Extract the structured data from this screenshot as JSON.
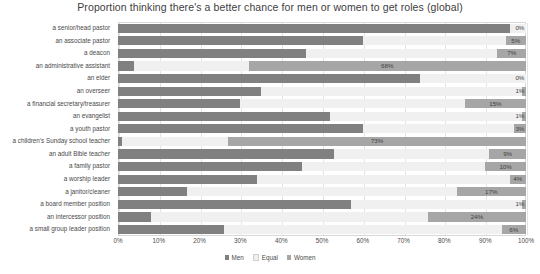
{
  "chart_data": {
    "type": "bar",
    "subtype": "stacked-horizontal-100",
    "title": "Proportion thinking there's a better chance for men or women to get roles (global)",
    "xlabel": "",
    "ylabel": "",
    "xlim": [
      0,
      100
    ],
    "xticks": [
      "0%",
      "10%",
      "20%",
      "30%",
      "40%",
      "50%",
      "60%",
      "70%",
      "80%",
      "90%",
      "100%"
    ],
    "grid": true,
    "legend_position": "bottom",
    "categories": [
      "a senior/head pastor",
      "an associate pastor",
      "a deacon",
      "an administrative assistant",
      "an elder",
      "an overseer",
      "a financial secretary/treasurer",
      "an evangelist",
      "a youth pastor",
      "a children's Sunday school teacher",
      "an adult Bible teacher",
      "a family pastor",
      "a worship leader",
      "a janitor/cleaner",
      "a board member position",
      "an intercessor position",
      "a small group leader position"
    ],
    "series": [
      {
        "name": "Men",
        "color": "#808080",
        "values": [
          96,
          60,
          46,
          4,
          74,
          35,
          30,
          52,
          60,
          1,
          53,
          45,
          34,
          17,
          57,
          8,
          26
        ]
      },
      {
        "name": "Equal",
        "color": "#f0f0f0",
        "values": [
          4,
          35,
          47,
          28,
          26,
          64,
          55,
          47,
          37,
          26,
          38,
          45,
          62,
          66,
          42,
          68,
          68
        ]
      },
      {
        "name": "Women",
        "color": "#a6a6a6",
        "values": [
          0,
          5,
          7,
          68,
          0,
          1,
          15,
          1,
          3,
          73,
          9,
          10,
          4,
          17,
          1,
          24,
          6
        ]
      }
    ],
    "data_labels": [
      "0%",
      "5%",
      "7%",
      "68%",
      "0%",
      "1%",
      "15%",
      "1%",
      "3%",
      "73%",
      "9%",
      "10%",
      "4%",
      "17%",
      "1%",
      "24%",
      "6%"
    ]
  },
  "legend": {
    "items": [
      {
        "label": "Men",
        "color": "#808080"
      },
      {
        "label": "Equal",
        "color": "#f0f0f0"
      },
      {
        "label": "Women",
        "color": "#a6a6a6"
      }
    ]
  }
}
